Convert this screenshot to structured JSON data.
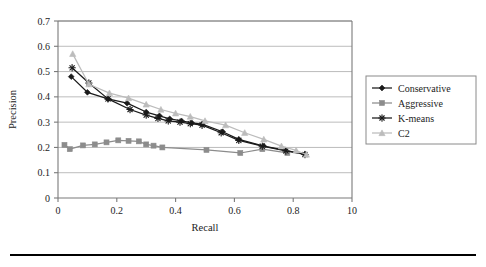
{
  "figure": {
    "background_color": "#ffffff",
    "bottom_rule_color": "#000000"
  },
  "chart_data": {
    "type": "line",
    "title": "",
    "xlabel": "Recall",
    "ylabel": "Precision",
    "xlim": [
      0,
      1.0
    ],
    "ylim": [
      0,
      0.7
    ],
    "xticks": [
      0,
      0.2,
      0.4,
      0.6,
      0.8,
      1.0
    ],
    "xtick_labels": [
      "0",
      "0.2",
      "0.4",
      "0.6",
      "0.8",
      "10"
    ],
    "yticks": [
      0,
      0.1,
      0.2,
      0.3,
      0.4,
      0.5,
      0.6,
      0.7
    ],
    "ytick_labels": [
      "0",
      "0.1",
      "0.2",
      "0.3",
      "0.4",
      "0.5",
      "0.6",
      "0.7"
    ],
    "grid": "horizontal",
    "grid_color": "#b4b4b4",
    "legend_position": "right",
    "series": [
      {
        "name": "Conservative",
        "color": "#1a1a1a",
        "marker": "diamond",
        "points": [
          [
            0.045,
            0.48
          ],
          [
            0.1,
            0.418
          ],
          [
            0.17,
            0.392
          ],
          [
            0.235,
            0.375
          ],
          [
            0.3,
            0.34
          ],
          [
            0.345,
            0.325
          ],
          [
            0.38,
            0.313
          ],
          [
            0.42,
            0.305
          ],
          [
            0.455,
            0.297
          ],
          [
            0.49,
            0.292
          ],
          [
            0.56,
            0.262
          ],
          [
            0.615,
            0.232
          ],
          [
            0.7,
            0.205
          ],
          [
            0.775,
            0.188
          ],
          [
            0.84,
            0.172
          ]
        ]
      },
      {
        "name": "Aggressive",
        "color": "#8c8c8c",
        "marker": "square",
        "points": [
          [
            0.022,
            0.21
          ],
          [
            0.04,
            0.193
          ],
          [
            0.085,
            0.208
          ],
          [
            0.125,
            0.212
          ],
          [
            0.165,
            0.22
          ],
          [
            0.205,
            0.228
          ],
          [
            0.24,
            0.226
          ],
          [
            0.275,
            0.224
          ],
          [
            0.3,
            0.212
          ],
          [
            0.325,
            0.207
          ],
          [
            0.355,
            0.2
          ],
          [
            0.505,
            0.19
          ],
          [
            0.62,
            0.178
          ],
          [
            0.695,
            0.193
          ],
          [
            0.78,
            0.178
          ]
        ]
      },
      {
        "name": "K-means",
        "color": "#1a1a1a",
        "marker": "asterisk",
        "points": [
          [
            0.048,
            0.515
          ],
          [
            0.105,
            0.455
          ],
          [
            0.17,
            0.392
          ],
          [
            0.245,
            0.35
          ],
          [
            0.3,
            0.328
          ],
          [
            0.34,
            0.315
          ],
          [
            0.375,
            0.305
          ],
          [
            0.415,
            0.3
          ],
          [
            0.45,
            0.294
          ],
          [
            0.49,
            0.288
          ],
          [
            0.555,
            0.258
          ],
          [
            0.615,
            0.228
          ],
          [
            0.695,
            0.205
          ],
          [
            0.775,
            0.186
          ],
          [
            0.84,
            0.172
          ]
        ]
      },
      {
        "name": "C2",
        "color": "#bcbcbc",
        "marker": "triangle",
        "points": [
          [
            0.05,
            0.57
          ],
          [
            0.105,
            0.45
          ],
          [
            0.175,
            0.415
          ],
          [
            0.24,
            0.395
          ],
          [
            0.3,
            0.37
          ],
          [
            0.35,
            0.35
          ],
          [
            0.4,
            0.335
          ],
          [
            0.45,
            0.322
          ],
          [
            0.5,
            0.305
          ],
          [
            0.57,
            0.288
          ],
          [
            0.635,
            0.258
          ],
          [
            0.7,
            0.232
          ],
          [
            0.76,
            0.205
          ],
          [
            0.81,
            0.188
          ],
          [
            0.845,
            0.172
          ]
        ]
      }
    ]
  }
}
